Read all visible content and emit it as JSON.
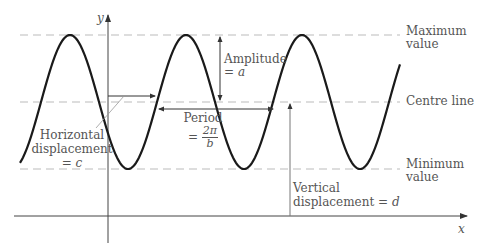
{
  "diagram": {
    "axes": {
      "x_label": "x",
      "y_label": "y"
    },
    "reference_lines": {
      "maximum": [
        "Maximum",
        "value"
      ],
      "centre": "Centre line",
      "minimum": [
        "Minimum",
        "value"
      ]
    },
    "annotations": {
      "amplitude": {
        "line1": "Amplitude",
        "line2_eq": "=",
        "line2_var": "a"
      },
      "period": {
        "line1": "Period",
        "eq": "=",
        "numerator": "2π",
        "denominator": "b"
      },
      "horizontal_displacement": {
        "line1": "Horizontal",
        "line2": "displacement",
        "line3_eq": "=",
        "line3_var": "c"
      },
      "vertical_displacement": {
        "line1": "Vertical",
        "line2": "displacement",
        "eq": "=",
        "var": "d"
      }
    },
    "colors": {
      "curve": "#1a1a1a",
      "dashed": "#bbbbbb",
      "axis": "#444444",
      "text": "#555555"
    }
  }
}
